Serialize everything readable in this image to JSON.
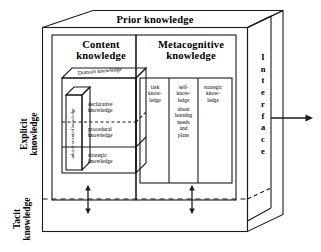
{
  "diagram": {
    "title": "Prior knowledge",
    "outer_box": {
      "label": "Prior knowledge",
      "side_label_letters": [
        "I",
        "n",
        "t",
        "e",
        "r",
        "f",
        "a",
        "c",
        "e"
      ],
      "side_label": "Interface"
    },
    "axis_labels": {
      "explicit": "Explicit\nknowledge",
      "tacit": "Tacit\nknowledge"
    },
    "columns": [
      {
        "id": "content-knowledge",
        "label": "Content\nknowledge",
        "inner_cube": {
          "top_label": "Domain knowledge",
          "side_label": "subject-oriented knowledge",
          "layers": [
            "declarative\nknowledge",
            "procedural\nknowledge",
            "strategic\nknowledge"
          ]
        }
      },
      {
        "id": "metacognitive-knowledge",
        "label": "Metacognitive\nknowledge",
        "sub_columns": [
          {
            "id": "task-knowledge",
            "label": "task\nknow-\nledge",
            "detail": ""
          },
          {
            "id": "self-knowledge",
            "label": "self-\nknow-\nledge",
            "detail": "about\nlearning\nneeds\nand\nplans"
          },
          {
            "id": "strategic-knowledge",
            "label": "strategic\nknow-\nledge",
            "detail": ""
          }
        ]
      }
    ],
    "connectors": {
      "boundary_line_style": "dashed",
      "vertical_arrows": 2,
      "output_arrow": "right"
    },
    "colors": {
      "stroke": "#1a1a1a",
      "background": "#ffffff",
      "text": "#000000"
    }
  }
}
